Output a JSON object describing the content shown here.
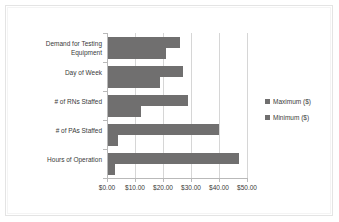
{
  "chart_data": {
    "type": "bar",
    "orientation": "horizontal",
    "title": "",
    "xlabel": "",
    "ylabel": "",
    "xlim": [
      0,
      50
    ],
    "xticks": [
      0,
      10,
      20,
      30,
      40,
      50
    ],
    "xtick_labels": [
      "$0.00",
      "$10.00",
      "$20.00",
      "$30.00",
      "$40.00",
      "$50.00"
    ],
    "grid": true,
    "legend_position": "right",
    "categories": [
      "Demand for Testing Equipment",
      "Day of Week",
      "# of RNs Staffed",
      "# of PAs Staffed",
      "Hours of Operation"
    ],
    "series": [
      {
        "name": "Maximum ($)",
        "color": "#706F6F",
        "values": [
          26,
          27,
          29,
          40,
          47
        ]
      },
      {
        "name": "Minimum ($)",
        "color": "#706F6F",
        "values": [
          21,
          19,
          12,
          4,
          3
        ]
      }
    ]
  },
  "legend": {
    "items": [
      {
        "label": "Maximum ($)",
        "marker": "legend-swatch-icon"
      },
      {
        "label": "Minimum ($)",
        "marker": "legend-swatch-icon"
      }
    ]
  },
  "axis": {
    "value_labels": [
      "$0.00",
      "$10.00",
      "$20.00",
      "$30.00",
      "$40.00",
      "$50.00"
    ],
    "category_labels": [
      "Demand for Testing Equipment",
      "Day of Week",
      "# of RNs Staffed",
      "# of PAs Staffed",
      "Hours of Operation"
    ]
  }
}
